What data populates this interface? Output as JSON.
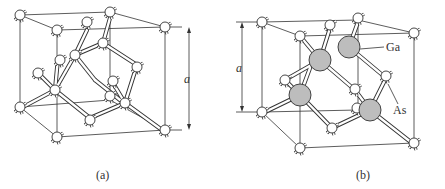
{
  "figure": {
    "panels": [
      {
        "id": "a",
        "caption": "(a)",
        "dimension_label": "a",
        "description": "Diamond cubic crystal structure (all atoms identical)"
      },
      {
        "id": "b",
        "caption": "(b)",
        "dimension_label": "a",
        "description": "Zincblende crystal structure (GaAs)",
        "atom_labels": {
          "ga": "Ga",
          "as": "As"
        }
      }
    ],
    "colors": {
      "line": "#333333",
      "atom_white": "#ffffff",
      "atom_gray": "#bdbdbd",
      "background": "#ffffff"
    }
  }
}
